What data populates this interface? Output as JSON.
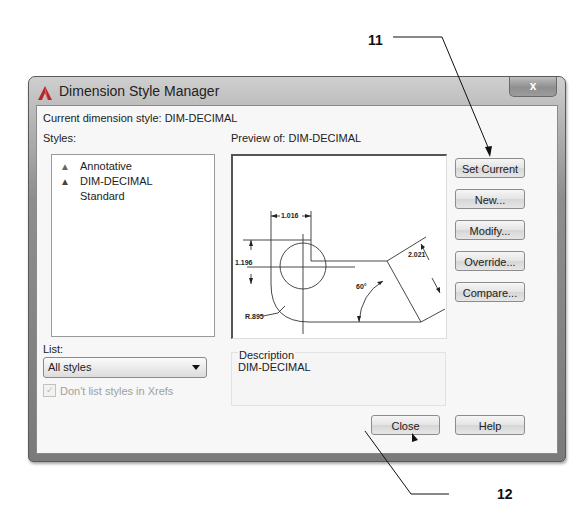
{
  "callouts": [
    {
      "number": "11",
      "target": "Set Current button"
    },
    {
      "number": "12",
      "target": "Close button"
    }
  ],
  "window": {
    "title": "Dimension Style Manager",
    "close_glyph": "x",
    "icon": "autocad-a-icon"
  },
  "current_style": {
    "label": "Current dimension style: DIM-DECIMAL"
  },
  "styles": {
    "label": "Styles:",
    "items": [
      {
        "name": "Annotative",
        "icon": "annotative-icon",
        "annotative": true
      },
      {
        "name": "DIM-DECIMAL",
        "icon": "annotative-icon",
        "annotative": true
      },
      {
        "name": "Standard",
        "icon": "",
        "annotative": false
      }
    ]
  },
  "list": {
    "label": "List:",
    "selected": "All styles",
    "checkbox_label": "Don't list styles in Xrefs",
    "checkbox_checked": true,
    "checkbox_enabled": false
  },
  "preview": {
    "label": "Preview of: DIM-DECIMAL",
    "dimensions": {
      "horizontal": "1.016",
      "vertical": "1.196",
      "aligned": "2.021",
      "angle": "60°",
      "radius": "R.895"
    }
  },
  "description": {
    "label": "Description",
    "value": "DIM-DECIMAL"
  },
  "buttons": {
    "set_current": "Set Current",
    "new": "New...",
    "modify": "Modify...",
    "override": "Override...",
    "compare": "Compare...",
    "close": "Close",
    "help": "Help"
  }
}
